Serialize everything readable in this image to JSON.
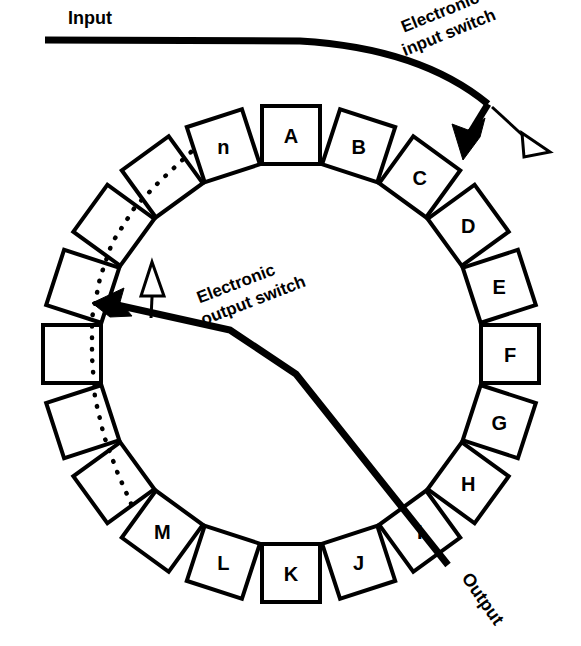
{
  "figure": {
    "background_color": "#ffffff",
    "ink_color": "#000000",
    "width": 581,
    "height": 646
  },
  "labels": {
    "input": "Input",
    "output": "Output",
    "input_switch_line1": "Electronic",
    "input_switch_line2": "input switch",
    "output_switch_line1": "Electronic",
    "output_switch_line2": "output switch"
  },
  "ring": {
    "center_x": 291,
    "center_y": 354,
    "radius": 219,
    "cell_size": 58,
    "step_degrees": 18,
    "count": 20,
    "cells": [
      {
        "id": "cell-a",
        "label": "A",
        "angle": 0
      },
      {
        "id": "cell-b",
        "label": "B",
        "angle": 18
      },
      {
        "id": "cell-c",
        "label": "C",
        "angle": 36
      },
      {
        "id": "cell-d",
        "label": "D",
        "angle": 54
      },
      {
        "id": "cell-e",
        "label": "E",
        "angle": 72
      },
      {
        "id": "cell-f",
        "label": "F",
        "angle": 90
      },
      {
        "id": "cell-g",
        "label": "G",
        "angle": 108
      },
      {
        "id": "cell-h",
        "label": "H",
        "angle": 126
      },
      {
        "id": "cell-i",
        "label": "I",
        "angle": 144
      },
      {
        "id": "cell-j",
        "label": "J",
        "angle": 162
      },
      {
        "id": "cell-k",
        "label": "K",
        "angle": 180
      },
      {
        "id": "cell-l",
        "label": "L",
        "angle": 198
      },
      {
        "id": "cell-m",
        "label": "M",
        "angle": 216
      },
      {
        "id": "cell-u1",
        "label": "",
        "angle": 234
      },
      {
        "id": "cell-u2",
        "label": "",
        "angle": 252
      },
      {
        "id": "cell-u3",
        "label": "",
        "angle": 270
      },
      {
        "id": "cell-u4",
        "label": "",
        "angle": 288
      },
      {
        "id": "cell-u5",
        "label": "",
        "angle": 306
      },
      {
        "id": "cell-u6",
        "label": "",
        "angle": 324
      },
      {
        "id": "cell-n",
        "label": "n",
        "angle": 342
      }
    ]
  },
  "input_switch": {
    "line_path": "M 45,40 L 300,41 Q 420,48 488,104",
    "elbow_path": "M 488,104 L 466,140",
    "pointer_path": "M 492,107 L 530,142",
    "solid_arrow_points": "463,160 452,124 468,130 485,118 480,137",
    "hollow_arrow_points": "522,133 550,152 524,157",
    "label_x": 398,
    "label_y": 18,
    "label_rotation": -22
  },
  "output_switch": {
    "line_path": "M 448,565 L 296,374 L 230,330 L 108,303",
    "solid_arrow_points": "92,303 124,288 120,302 132,316 110,317",
    "stem_path": "M 151,318 L 153,277",
    "hollow_arrow_points": "152,262 164,296 141,296",
    "label_x": 190,
    "label_y": 290,
    "label_rotation": -21
  },
  "dotted_chain": {
    "path": "M 191,152 L 160,181 L 135,207 L 112,243 L 100,278 L 92,318 L 92,357 L 95,398 L 104,436 L 118,474 L 133,508"
  },
  "output_label": {
    "x": 461,
    "y": 578,
    "rotation": 55
  },
  "input_label": {
    "x": 68,
    "y": 8
  }
}
